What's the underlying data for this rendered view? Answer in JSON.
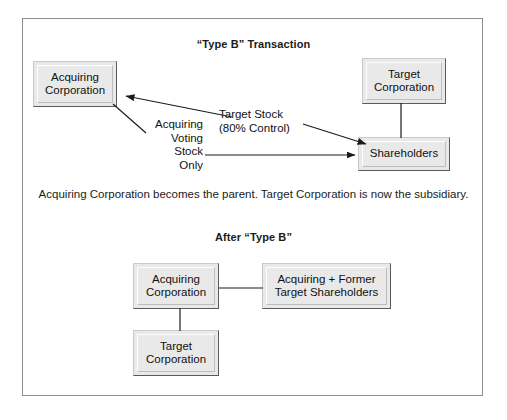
{
  "figure": {
    "sections": {
      "top": {
        "title": "“Type B” Transaction"
      },
      "after": {
        "title": "After “Type B”"
      }
    },
    "caption": "Acquiring Corporation becomes the parent.\nTarget Corporation is now the subsidiary.",
    "boxes": {
      "acquiring_top": "Acquiring\nCorporation",
      "target_top": "Target\nCorporation",
      "shareholders": "Shareholders",
      "acquiring_after": "Acquiring\nCorporation",
      "former_shareholders": "Acquiring + Former\nTarget Shareholders",
      "target_after": "Target\nCorporation"
    },
    "edge_labels": {
      "voting_stock": "Acquiring\nVoting\nStock\nOnly",
      "target_stock": "Target Stock\n(80% Control)"
    },
    "colors": {
      "box_fill": "#e9e9e9",
      "box_border": "#6f6f6f",
      "box_shadow": "#b7b7b7",
      "frame_border": "#8e8e8e",
      "text": "#111111",
      "background": "#ffffff"
    }
  }
}
